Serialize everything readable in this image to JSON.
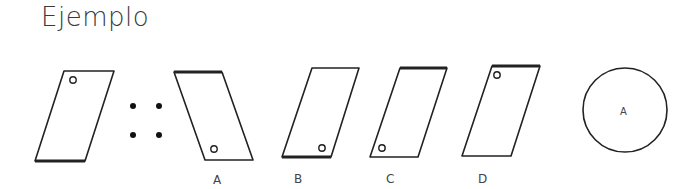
{
  "title": "Ejemplo",
  "analogy": {
    "premise_shape": "parallelogram-leaning-right-circle-top-left",
    "separator": "double-colon-dots",
    "options": [
      {
        "label": "A",
        "shape": "parallelogram-leaning-left-circle-bottom-right"
      },
      {
        "label": "B",
        "shape": "parallelogram-leaning-right-circle-bottom-right"
      },
      {
        "label": "C",
        "shape": "parallelogram-leaning-right-circle-bottom-left"
      },
      {
        "label": "D",
        "shape": "parallelogram-leaning-right-circle-top-left"
      }
    ],
    "answer_circle_label": "A"
  }
}
